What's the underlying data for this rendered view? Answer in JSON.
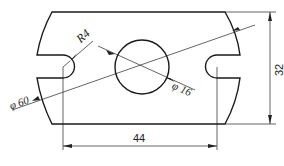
{
  "drawing": {
    "type": "mechanical part drawing",
    "colors": {
      "line": "#1a1a1a",
      "background": "#ffffff"
    },
    "dimensions": {
      "radius_label": "R4",
      "outer_diameter_label": "φ 60",
      "hole_diameter_label": "φ 16",
      "height_label": "32",
      "width_label": "44"
    }
  }
}
